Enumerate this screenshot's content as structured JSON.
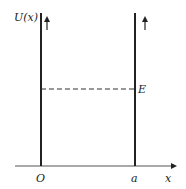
{
  "diagram": {
    "labels": {
      "y_axis": "U(x)",
      "x_axis": "x",
      "origin": "O",
      "right_wall": "a",
      "energy": "E"
    },
    "colors": {
      "line": "#222222",
      "background": "#ffffff"
    }
  }
}
